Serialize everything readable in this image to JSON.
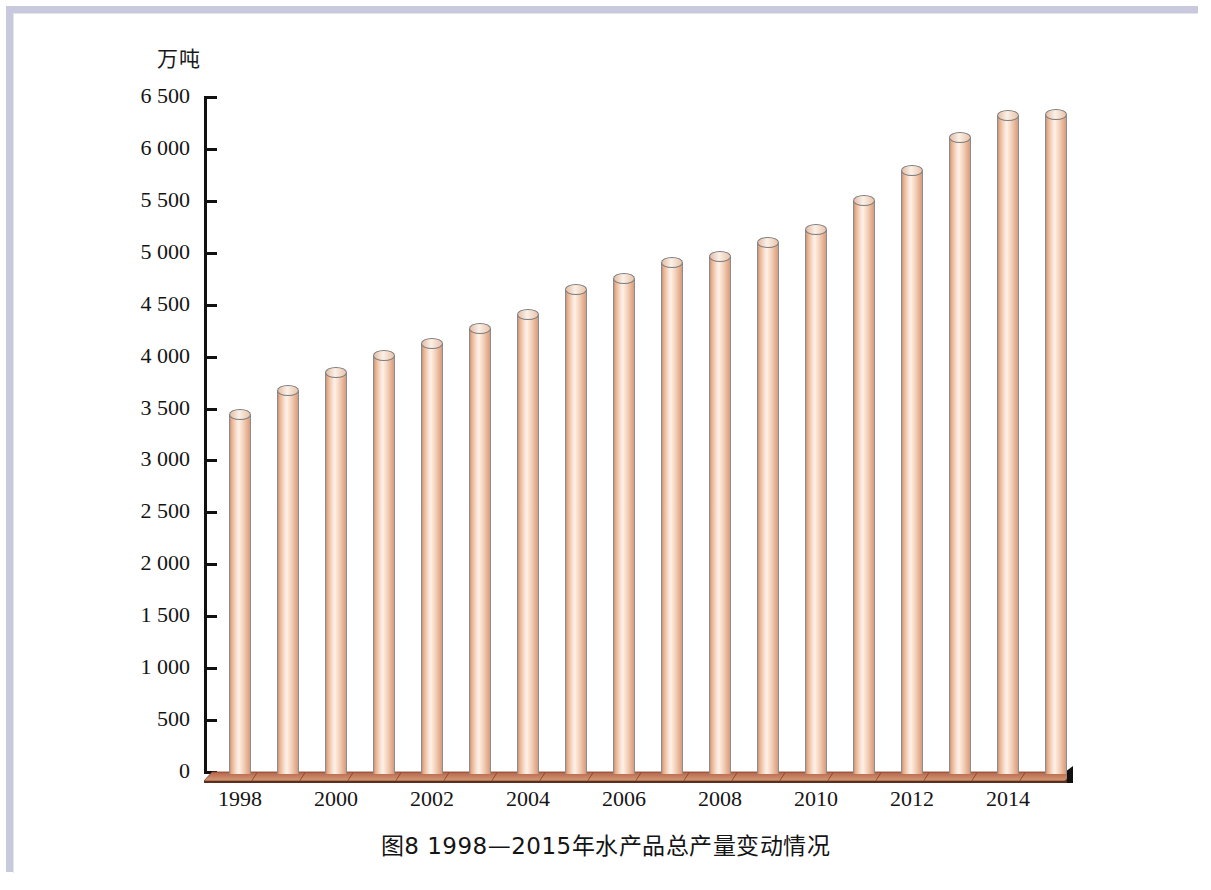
{
  "figure": {
    "caption": "图8    1998—2015年水产品总产量变动情况",
    "y_axis_unit": "万吨"
  },
  "chart_data": {
    "type": "bar",
    "xlabel": "",
    "ylabel": "万吨",
    "ylim": [
      0,
      6500
    ],
    "grid": false,
    "legend": null,
    "y_ticks": [
      0,
      500,
      1000,
      1500,
      2000,
      2500,
      3000,
      3500,
      4000,
      4500,
      5000,
      5500,
      6000,
      6500
    ],
    "y_tick_labels": [
      "0",
      "500",
      "1 000",
      "1 500",
      "2 000",
      "2 500",
      "3 000",
      "3 500",
      "4 000",
      "4 500",
      "5 000",
      "5 500",
      "6 000",
      "6 500"
    ],
    "categories": [
      "1998",
      "1999",
      "2000",
      "2001",
      "2002",
      "2003",
      "2004",
      "2005",
      "2006",
      "2007",
      "2008",
      "2009",
      "2010",
      "2011",
      "2012",
      "2013",
      "2014",
      "2015"
    ],
    "x_tick_labels_shown": [
      "1998",
      "2000",
      "2002",
      "2004",
      "2006",
      "2008",
      "2010",
      "2012",
      "2014"
    ],
    "values": [
      3440,
      3670,
      3840,
      4010,
      4120,
      4270,
      4400,
      4640,
      4750,
      4900,
      4960,
      5090,
      5220,
      5500,
      5790,
      6110,
      6320,
      6330
    ],
    "bar_color": "#f2c7aa",
    "bar_outline_color": "#8c8c8c",
    "baseline_color": "#a8593a"
  },
  "colors": {
    "frame": "#c9c9de",
    "axis": "#111111",
    "text": "#141414"
  }
}
